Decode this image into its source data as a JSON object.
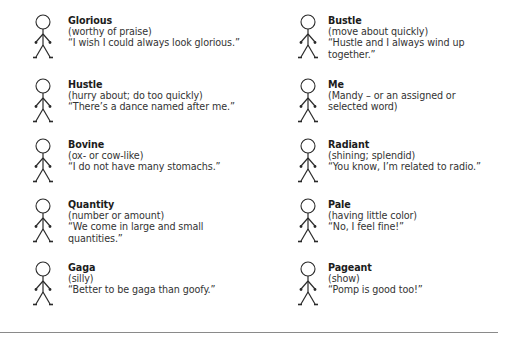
{
  "page": {
    "background": "#ffffff",
    "rule_color": "#8a8a8a"
  },
  "columns": [
    {
      "entries": [
        {
          "word": "Glorious",
          "definition": "(worthy of praise)",
          "quote": "“I wish I could always look glorious.”",
          "icon": "stick-figure-icon"
        },
        {
          "word": "Hustle",
          "definition": "(hurry about; do too quickly)",
          "quote": "“There’s  a dance named after me.”",
          "icon": "stick-figure-icon"
        },
        {
          "word": "Bovine",
          "definition": "(ox- or cow-like)",
          "quote": "“I do not have many stomachs.”",
          "icon": "stick-figure-icon"
        },
        {
          "word": "Quantity",
          "definition": "(number or amount)",
          "quote": "“We come in large and small quantities.”",
          "icon": "stick-figure-icon"
        },
        {
          "word": "Gaga",
          "definition": "(silly)",
          "quote": "“Better to be gaga than goofy.”",
          "icon": "stick-figure-icon"
        }
      ]
    },
    {
      "entries": [
        {
          "word": "Bustle",
          "definition": "(move about quickly)",
          "quote": "“Hustle and I always wind up together.”",
          "icon": "stick-figure-icon"
        },
        {
          "word": "Me",
          "definition": "(Mandy – or an assigned or selected word)",
          "quote": "",
          "icon": "stick-figure-icon"
        },
        {
          "word": "Radiant",
          "definition": "(shining; splendid)",
          "quote": "“You know, I’m related to radio.”",
          "icon": "stick-figure-icon"
        },
        {
          "word": "Pale",
          "definition": "(having little color)",
          "quote": "“No, I feel fine!”",
          "icon": "stick-figure-icon"
        },
        {
          "word": "Pageant",
          "definition": "(show)",
          "quote": "“Pomp is good too!”",
          "icon": "stick-figure-icon"
        }
      ]
    }
  ]
}
